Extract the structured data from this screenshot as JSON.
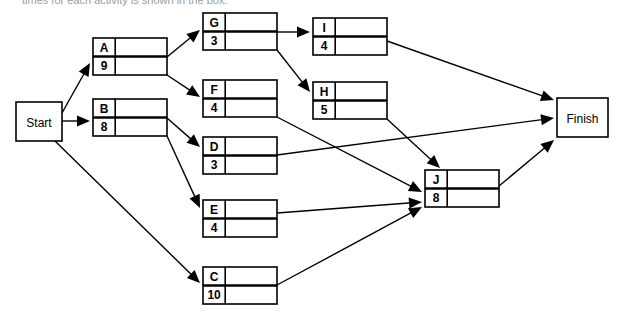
{
  "page": {
    "header_fragment": "times for each activity is shown in the box."
  },
  "diagram": {
    "type": "activity-on-node-network",
    "terminals": [
      {
        "id": "start",
        "label": "Start",
        "x": 16,
        "y": 102,
        "w": 46,
        "h": 39
      },
      {
        "id": "finish",
        "label": "Finish",
        "x": 557,
        "y": 98,
        "w": 51,
        "h": 39
      }
    ],
    "nodes": [
      {
        "id": "A",
        "label": "A",
        "duration": "9",
        "x": 93,
        "y": 38,
        "w": 74,
        "h": 37
      },
      {
        "id": "B",
        "label": "B",
        "duration": "8",
        "x": 93,
        "y": 99,
        "w": 74,
        "h": 37
      },
      {
        "id": "G",
        "label": "G",
        "duration": "3",
        "x": 203,
        "y": 13,
        "w": 74,
        "h": 37
      },
      {
        "id": "F",
        "label": "F",
        "duration": "4",
        "x": 203,
        "y": 80,
        "w": 74,
        "h": 37
      },
      {
        "id": "D",
        "label": "D",
        "duration": "3",
        "x": 203,
        "y": 137,
        "w": 74,
        "h": 37
      },
      {
        "id": "E",
        "label": "E",
        "duration": "4",
        "x": 203,
        "y": 200,
        "w": 74,
        "h": 37
      },
      {
        "id": "C",
        "label": "C",
        "duration": "10",
        "x": 203,
        "y": 267,
        "w": 74,
        "h": 37
      },
      {
        "id": "I",
        "label": "I",
        "duration": "4",
        "x": 313,
        "y": 18,
        "w": 74,
        "h": 37
      },
      {
        "id": "H",
        "label": "H",
        "duration": "5",
        "x": 313,
        "y": 82,
        "w": 74,
        "h": 37
      },
      {
        "id": "J",
        "label": "J",
        "duration": "8",
        "x": 425,
        "y": 170,
        "w": 74,
        "h": 37
      }
    ],
    "edges": [
      {
        "id": "start-A",
        "from": "Start",
        "to": "A",
        "x1": 62,
        "y1": 113,
        "x2": 90,
        "y2": 63
      },
      {
        "id": "start-B",
        "from": "Start",
        "to": "B",
        "x1": 62,
        "y1": 121,
        "x2": 90,
        "y2": 121
      },
      {
        "id": "start-C",
        "from": "Start",
        "to": "C",
        "x1": 55,
        "y1": 141,
        "x2": 200,
        "y2": 283
      },
      {
        "id": "A-G",
        "from": "A",
        "to": "G",
        "x1": 167,
        "y1": 57,
        "x2": 200,
        "y2": 30
      },
      {
        "id": "A-F",
        "from": "A",
        "to": "F",
        "x1": 167,
        "y1": 75,
        "x2": 200,
        "y2": 97
      },
      {
        "id": "B-D",
        "from": "B",
        "to": "D",
        "x1": 167,
        "y1": 118,
        "x2": 200,
        "y2": 147
      },
      {
        "id": "B-E",
        "from": "B",
        "to": "E",
        "x1": 167,
        "y1": 136,
        "x2": 200,
        "y2": 208
      },
      {
        "id": "G-I",
        "from": "G",
        "to": "I",
        "x1": 277,
        "y1": 32,
        "x2": 310,
        "y2": 32
      },
      {
        "id": "G-H",
        "from": "G",
        "to": "H",
        "x1": 277,
        "y1": 50,
        "x2": 310,
        "y2": 92
      },
      {
        "id": "F-J",
        "from": "F",
        "to": "J",
        "x1": 277,
        "y1": 117,
        "x2": 422,
        "y2": 192
      },
      {
        "id": "D-Finish",
        "from": "D",
        "to": "Finish",
        "x1": 277,
        "y1": 155,
        "x2": 554,
        "y2": 118
      },
      {
        "id": "E-J",
        "from": "E",
        "to": "J",
        "x1": 277,
        "y1": 213,
        "x2": 422,
        "y2": 202
      },
      {
        "id": "C-J",
        "from": "C",
        "to": "J",
        "x1": 277,
        "y1": 285,
        "x2": 422,
        "y2": 207
      },
      {
        "id": "I-Finish",
        "from": "I",
        "to": "Finish",
        "x1": 387,
        "y1": 41,
        "x2": 554,
        "y2": 100
      },
      {
        "id": "H-J",
        "from": "H",
        "to": "J",
        "x1": 387,
        "y1": 119,
        "x2": 440,
        "y2": 168
      },
      {
        "id": "J-Finish",
        "from": "J",
        "to": "Finish",
        "x1": 499,
        "y1": 186,
        "x2": 554,
        "y2": 140
      }
    ],
    "colors": {
      "stroke": "#000000",
      "fill": "#ffffff",
      "background": "#ffffff"
    }
  }
}
